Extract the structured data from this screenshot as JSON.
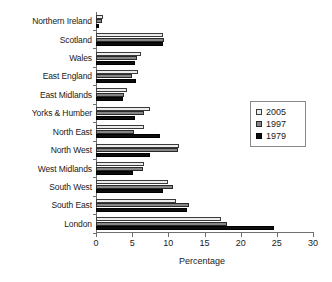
{
  "chart_data": {
    "type": "bar",
    "orientation": "horizontal",
    "title": "",
    "xlabel": "Percentage",
    "ylabel": "",
    "xlim": [
      0,
      30
    ],
    "xticks": [
      0,
      5,
      10,
      15,
      20,
      25,
      30
    ],
    "grid": false,
    "legend_position": "right",
    "categories": [
      "Northern Ireland",
      "Scotland",
      "Wales",
      "East England",
      "East Midlands",
      "Yorks & Humber",
      "North East",
      "North West",
      "West Midlands",
      "South West",
      "South East",
      "London"
    ],
    "series": [
      {
        "name": "2005",
        "color": "#ececec",
        "values": [
          1.0,
          9.3,
          6.2,
          5.8,
          4.3,
          7.4,
          6.6,
          11.5,
          6.7,
          9.9,
          11.1,
          17.3
        ]
      },
      {
        "name": "1997",
        "color": "#868686",
        "values": [
          0.8,
          9.4,
          5.6,
          5.0,
          3.9,
          6.6,
          5.3,
          11.3,
          6.5,
          10.6,
          12.9,
          18.1
        ]
      },
      {
        "name": "1979",
        "color": "#0d0d0d",
        "values": [
          0.4,
          9.2,
          5.4,
          5.5,
          3.7,
          5.4,
          8.8,
          7.5,
          5.1,
          9.2,
          12.6,
          24.6
        ]
      }
    ]
  },
  "legend": {
    "items": [
      {
        "label": "2005"
      },
      {
        "label": "1997"
      },
      {
        "label": "1979"
      }
    ]
  }
}
